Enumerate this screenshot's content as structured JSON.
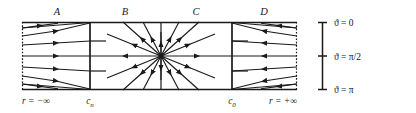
{
  "figure": {
    "type": "phase-portrait-diagram",
    "title": "",
    "panels": [
      {
        "id": "A",
        "label": "A",
        "x_center": 57
      },
      {
        "id": "B",
        "label": "B",
        "x_center": 125
      },
      {
        "id": "C",
        "label": "C",
        "x_center": 196
      },
      {
        "id": "D",
        "label": "D",
        "x_center": 264
      }
    ],
    "axis_bottom": {
      "ticks": [
        {
          "label_main": "r",
          "label_rel": "=",
          "label_value": "−∞",
          "x": 38
        },
        {
          "label_main": "c",
          "label_sub": "n",
          "x": 90
        },
        {
          "label_main": "c",
          "label_sub": "0",
          "x": 232
        },
        {
          "label_main": "r",
          "label_rel": "=",
          "label_value": "+∞",
          "x": 281
        }
      ],
      "left_label": "r = −∞",
      "cn_label": "c",
      "cn_sub": "n",
      "c0_label": "c",
      "c0_sub": "0",
      "right_label": "r = +∞"
    },
    "legend": {
      "orientation": "vertical",
      "axis_x": 322,
      "top": 22,
      "bottom": 90,
      "ticks": [
        {
          "value": "0",
          "symbol": "ϑ",
          "relation": "=",
          "y": 22,
          "text": "ϑ = 0"
        },
        {
          "value": "π/2",
          "symbol": "ϑ",
          "relation": "=",
          "y": 56,
          "text": "ϑ = π/2"
        },
        {
          "value": "π",
          "symbol": "ϑ",
          "relation": "=",
          "y": 90,
          "text": "ϑ = π"
        }
      ]
    },
    "box": {
      "left": 22,
      "right": 297,
      "top": 22,
      "bottom": 90,
      "left_edge_style": "dotted",
      "right_edge_style": "dotted",
      "top_edge_style": "solid",
      "bottom_edge_style": "solid",
      "separator_cn_x": 90,
      "separator_c0_x": 232,
      "center_x": 161,
      "center_y": 56
    },
    "colors": {
      "line": "#1a1a1a",
      "background": "#ffffff",
      "text": "#1a1a1a"
    }
  }
}
